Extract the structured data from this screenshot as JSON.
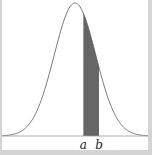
{
  "chart_data": {
    "type": "area",
    "title": "",
    "distribution": {
      "name": "normal",
      "mean": 0,
      "sd": 1
    },
    "x_range": [
      -3.5,
      3.5
    ],
    "shaded_region": {
      "from_label": "a",
      "to_label": "b",
      "from": 0.4,
      "to": 1.15
    },
    "tick_labels": [
      "a",
      "b"
    ],
    "xlabel": "",
    "ylabel": "",
    "grid": false,
    "legend": null,
    "colors": {
      "curve": "#555555",
      "shade": "#666666",
      "axis": "#999999",
      "border": "#d4d4d4"
    }
  }
}
